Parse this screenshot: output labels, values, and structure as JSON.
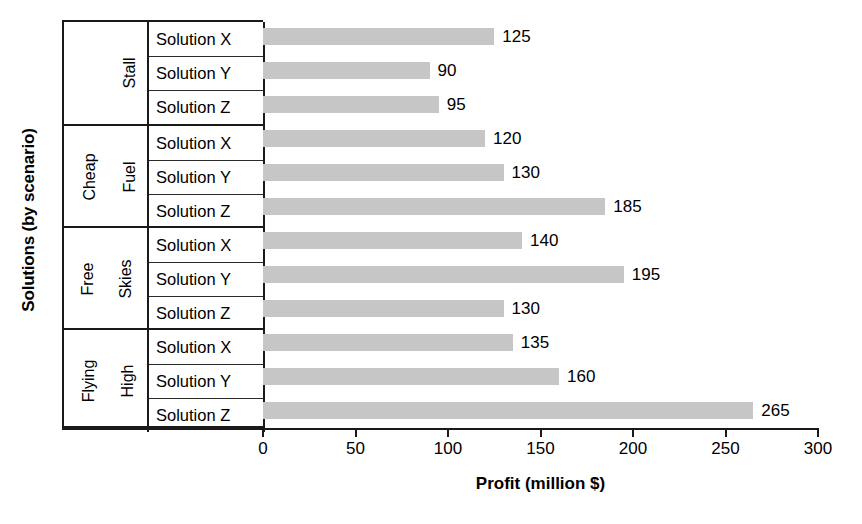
{
  "chart_data": {
    "type": "bar",
    "orientation": "horizontal",
    "title": "",
    "xlabel": "Profit (million $)",
    "ylabel": "Solutions (by scenario)",
    "xlim": [
      0,
      300
    ],
    "xticks": [
      0,
      50,
      100,
      150,
      200,
      250,
      300
    ],
    "grid": false,
    "legend": false,
    "bar_color": "#c6c6c6",
    "groups": [
      {
        "scenario": "Stall",
        "scenario_lines": [
          "Stall"
        ],
        "rows": [
          {
            "label": "Solution X",
            "value": 125
          },
          {
            "label": "Solution Y",
            "value": 90
          },
          {
            "label": "Solution Z",
            "value": 95
          }
        ]
      },
      {
        "scenario": "Cheap Fuel",
        "scenario_lines": [
          "Cheap",
          "Fuel"
        ],
        "rows": [
          {
            "label": "Solution X",
            "value": 120
          },
          {
            "label": "Solution Y",
            "value": 130
          },
          {
            "label": "Solution Z",
            "value": 185
          }
        ]
      },
      {
        "scenario": "Free Skies",
        "scenario_lines": [
          "Free",
          "Skies"
        ],
        "rows": [
          {
            "label": "Solution X",
            "value": 140
          },
          {
            "label": "Solution Y",
            "value": 195
          },
          {
            "label": "Solution Z",
            "value": 130
          }
        ]
      },
      {
        "scenario": "Flying High",
        "scenario_lines": [
          "Flying",
          "High"
        ],
        "rows": [
          {
            "label": "Solution X",
            "value": 135
          },
          {
            "label": "Solution Y",
            "value": 160
          },
          {
            "label": "Solution Z",
            "value": 265
          }
        ]
      }
    ],
    "categories": [
      "Stall / Solution X",
      "Stall / Solution Y",
      "Stall / Solution Z",
      "Cheap Fuel / Solution X",
      "Cheap Fuel / Solution Y",
      "Cheap Fuel / Solution Z",
      "Free Skies / Solution X",
      "Free Skies / Solution Y",
      "Free Skies / Solution Z",
      "Flying High / Solution X",
      "Flying High / Solution Y",
      "Flying High / Solution Z"
    ],
    "values": [
      125,
      90,
      95,
      120,
      130,
      185,
      140,
      195,
      130,
      135,
      160,
      265
    ]
  }
}
